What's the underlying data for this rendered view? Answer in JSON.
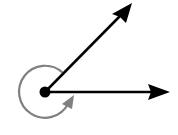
{
  "diagram": {
    "type": "reflex-angle",
    "colors": {
      "rays": "#000000",
      "arc": "#808080",
      "background": "#ffffff"
    },
    "vertex": {
      "x": 45,
      "y": 92,
      "radius": 5
    },
    "rays": [
      {
        "name": "horizontal-ray",
        "x2": 170,
        "y2": 92
      },
      {
        "name": "diagonal-ray",
        "x2": 132,
        "y2": 3
      }
    ],
    "arc": {
      "radius": 26,
      "direction": "counter-clockwise",
      "description": "reflex angle indicator"
    }
  }
}
